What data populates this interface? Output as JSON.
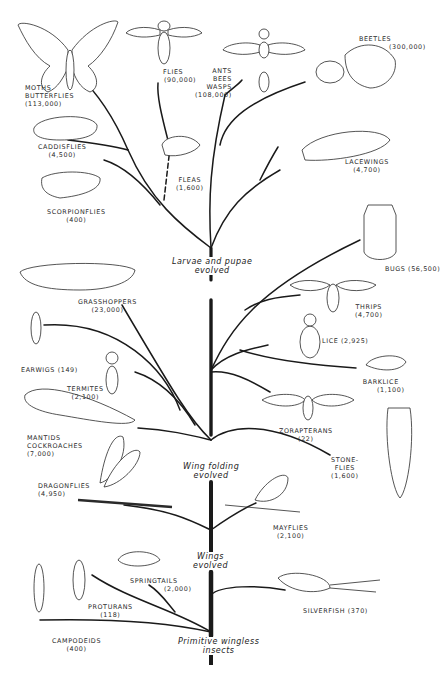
{
  "diagram": {
    "stages": [
      {
        "id": "primitive",
        "line1": "Primitive wingless",
        "line2": "insects"
      },
      {
        "id": "wings",
        "line1": "Wings",
        "line2": "evolved"
      },
      {
        "id": "wing_folding",
        "line1": "Wing folding",
        "line2": "evolved"
      },
      {
        "id": "larvae",
        "line1": "Larvae and pupae",
        "line2": "evolved"
      }
    ],
    "orders": [
      {
        "id": "moths",
        "lines": [
          "MOTHS",
          "BUTTERFLIES",
          "(113,000)"
        ],
        "species": 113000,
        "stage": "larvae"
      },
      {
        "id": "flies",
        "lines": [
          "FLIES",
          "(90,000)"
        ],
        "species": 90000,
        "stage": "larvae"
      },
      {
        "id": "ants",
        "lines": [
          "ANTS",
          "BEES",
          "WASPS",
          "(108,000)"
        ],
        "species": 108000,
        "stage": "larvae"
      },
      {
        "id": "beetles",
        "lines": [
          "BEETLES",
          "(300,000)"
        ],
        "species": 300000,
        "stage": "larvae"
      },
      {
        "id": "caddisflies",
        "lines": [
          "CADDISFLIES",
          "(4,500)"
        ],
        "species": 4500,
        "stage": "larvae"
      },
      {
        "id": "fleas",
        "lines": [
          "FLEAS",
          "(1,600)"
        ],
        "species": 1600,
        "stage": "larvae"
      },
      {
        "id": "lacewings",
        "lines": [
          "LACEWINGS",
          "(4,700)"
        ],
        "species": 4700,
        "stage": "larvae"
      },
      {
        "id": "scorpionflies",
        "lines": [
          "SCORPIONFLIES",
          "(400)"
        ],
        "species": 400,
        "stage": "larvae"
      },
      {
        "id": "bugs",
        "lines": [
          "BUGS (56,500)"
        ],
        "species": 56500,
        "stage": "wing_folding"
      },
      {
        "id": "grasshoppers",
        "lines": [
          "GRASSHOPPERS",
          "(23,000)"
        ],
        "species": 23000,
        "stage": "wing_folding"
      },
      {
        "id": "thrips",
        "lines": [
          "THRIPS",
          "(4,700)"
        ],
        "species": 4700,
        "stage": "wing_folding"
      },
      {
        "id": "lice",
        "lines": [
          "LICE (2,925)"
        ],
        "species": 2925,
        "stage": "wing_folding"
      },
      {
        "id": "earwigs",
        "lines": [
          "EARWIGS (149)"
        ],
        "species": 149,
        "stage": "wing_folding"
      },
      {
        "id": "termites",
        "lines": [
          "TERMITES",
          "(2,100)"
        ],
        "species": 2100,
        "stage": "wing_folding"
      },
      {
        "id": "barklice",
        "lines": [
          "BARKLICE",
          "(1,100)"
        ],
        "species": 1100,
        "stage": "wing_folding"
      },
      {
        "id": "mantids",
        "lines": [
          "MANTIDS",
          "COCKROACHES",
          "(7,000)"
        ],
        "species": 7000,
        "stage": "wing_folding"
      },
      {
        "id": "zorapterans",
        "lines": [
          "ZORAPTERANS",
          "(22)"
        ],
        "species": 22,
        "stage": "wing_folding"
      },
      {
        "id": "stoneflies",
        "lines": [
          "STONE-",
          "FLIES",
          "(1,600)"
        ],
        "species": 1600,
        "stage": "wing_folding"
      },
      {
        "id": "dragonflies",
        "lines": [
          "DRAGONFLIES",
          "(4,950)"
        ],
        "species": 4950,
        "stage": "wings"
      },
      {
        "id": "mayflies",
        "lines": [
          "MAYFLIES",
          "(2,100)"
        ],
        "species": 2100,
        "stage": "wings"
      },
      {
        "id": "springtails",
        "lines": [
          "SPRINGTAILS",
          "(2,000)"
        ],
        "species": 2000,
        "stage": "primitive"
      },
      {
        "id": "proturans",
        "lines": [
          "PROTURANS",
          "(118)"
        ],
        "species": 118,
        "stage": "primitive"
      },
      {
        "id": "silverfish",
        "lines": [
          "SILVERFISH (370)"
        ],
        "species": 370,
        "stage": "primitive"
      },
      {
        "id": "campodeids",
        "lines": [
          "CAMPODEIDS",
          "(400)"
        ],
        "species": 400,
        "stage": "primitive"
      }
    ],
    "colors": {
      "ink": "#1a1a1a",
      "paper": "#ffffff",
      "label": "#2a2a2a"
    }
  }
}
